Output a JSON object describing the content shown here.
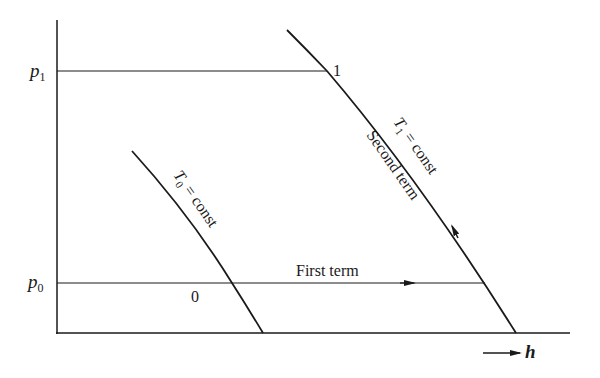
{
  "diagram": {
    "type": "thermodynamic p-h diagram",
    "axes": {
      "y_labels": [
        {
          "main": "p",
          "sub": "1"
        },
        {
          "main": "p",
          "sub": "0"
        }
      ],
      "x_label": "h"
    },
    "curves": {
      "t1": {
        "main": "T",
        "sub": "1",
        "rest": " = const",
        "second": "Second term"
      },
      "t0": {
        "main": "T",
        "sub": "0",
        "rest": " = const"
      }
    },
    "points": {
      "state1": "1",
      "state0": "0"
    },
    "annotations": {
      "first_term": "First term"
    },
    "colors": {
      "line": "#1a1a1a",
      "background": "#ffffff"
    }
  }
}
